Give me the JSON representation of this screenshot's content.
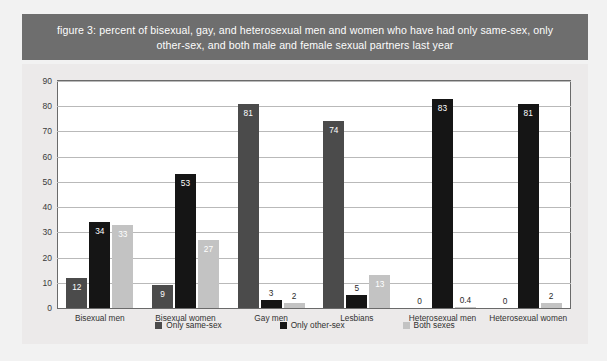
{
  "title": "figure 3: percent of bisexual, gay, and heterosexual men and women who have had only same-sex, only other-sex, and both male and female sexual partners last year",
  "colors": {
    "banner": "#6e6e6e",
    "page_background": "#f2f2f2",
    "chart_background": "#eceaea",
    "plot_background": "#ffffff",
    "series_only_same_sex": "#4b4b4b",
    "series_only_other_sex": "#151515",
    "series_both_sexes": "#c3c3c3",
    "gridline": "#b9b9b9",
    "axis_text": "#333333"
  },
  "chart_data": {
    "type": "bar",
    "title": "figure 3: percent of bisexual, gay, and heterosexual men and women who have had only same-sex, only other-sex, and both male and female sexual partners last year",
    "xlabel": "",
    "ylabel": "",
    "ylim": [
      0,
      90
    ],
    "yticks": [
      0,
      10,
      20,
      30,
      40,
      50,
      60,
      70,
      80,
      90
    ],
    "grid": true,
    "legend_position": "bottom",
    "categories": [
      "Bisexual men",
      "Bisexual women",
      "Gay men",
      "Lesbians",
      "Heterosexual men",
      "Heterosexual women"
    ],
    "series": [
      {
        "name": "Only same-sex",
        "color": "#4b4b4b",
        "values": [
          12,
          9,
          81,
          74,
          0,
          0
        ],
        "labels": [
          "12",
          "9",
          "81",
          "74",
          "0",
          "0"
        ]
      },
      {
        "name": "Only other-sex",
        "color": "#151515",
        "values": [
          34,
          53,
          3,
          5,
          83,
          81
        ],
        "labels": [
          "34",
          "53",
          "3",
          "5",
          "83",
          "81"
        ]
      },
      {
        "name": "Both sexes",
        "color": "#c3c3c3",
        "values": [
          33,
          27,
          2,
          13,
          0.4,
          2
        ],
        "labels": [
          "33",
          "27",
          "2",
          "13",
          "0.4",
          "2"
        ]
      }
    ]
  }
}
